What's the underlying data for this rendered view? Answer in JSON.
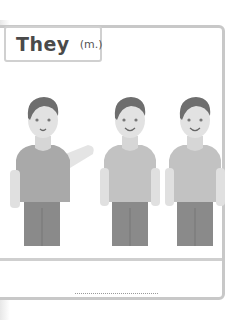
{
  "card": {
    "title": "They",
    "subtitle": "(m.)",
    "answer_line": ""
  },
  "illustration": {
    "description": "three men standing, left one gesturing",
    "figures": [
      {
        "pose": "gesturing",
        "x": 10
      },
      {
        "pose": "standing",
        "x": 100
      },
      {
        "pose": "standing",
        "x": 166
      }
    ],
    "colors": {
      "hair": "#6e6e6e",
      "skin": "#e2e2e2",
      "shirt_left": "#a9a9a9",
      "shirt": "#c2c2c2",
      "pants": "#8a8a8a",
      "outline": "#c8c8c8"
    }
  }
}
